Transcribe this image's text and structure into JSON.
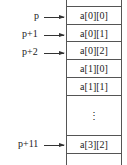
{
  "cells": [
    {
      "label": "",
      "height": 8
    },
    {
      "label": "a[0][0]",
      "height": 18
    },
    {
      "label": "a[0][1]",
      "height": 17
    },
    {
      "label": "a[0][2]",
      "height": 18
    },
    {
      "label": "a[1][0]",
      "height": 18
    },
    {
      "label": "a[1][1]",
      "height": 18
    },
    {
      "label": "⋮",
      "height": 36
    },
    {
      "label": "a[3][2]",
      "height": 18
    },
    {
      "label": "",
      "height": 20
    }
  ],
  "pointers": [
    {
      "label": "p",
      "y": 16
    },
    {
      "label": "p+1",
      "y": 34
    },
    {
      "label": "p+2",
      "y": 52
    },
    {
      "label": "p+11",
      "y": 144
    }
  ]
}
